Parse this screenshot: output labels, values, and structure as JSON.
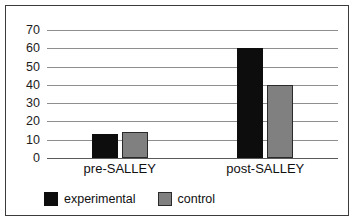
{
  "chart_data": {
    "type": "bar",
    "title": "",
    "xlabel": "",
    "ylabel": "",
    "categories": [
      "pre-SALLEY",
      "post-SALLEY"
    ],
    "series": [
      {
        "name": "experimental",
        "color": "#0d0d0d",
        "values": [
          13,
          60
        ]
      },
      {
        "name": "control",
        "color": "#808080",
        "values": [
          14,
          40
        ]
      }
    ],
    "ylim": [
      0,
      70
    ],
    "ytick_values": [
      0,
      10,
      20,
      30,
      40,
      50,
      60,
      70
    ],
    "ytick_labels": [
      "0",
      "10",
      "20",
      "30",
      "40",
      "50",
      "60",
      "70"
    ],
    "grid": true,
    "legend_position": "bottom-left"
  },
  "axis": {
    "yticks": [
      {
        "label": "70",
        "value": 70
      },
      {
        "label": "60",
        "value": 60
      },
      {
        "label": "50",
        "value": 50
      },
      {
        "label": "40",
        "value": 40
      },
      {
        "label": "30",
        "value": 30
      },
      {
        "label": "20",
        "value": 20
      },
      {
        "label": "10",
        "value": 10
      },
      {
        "label": "0",
        "value": 0
      }
    ]
  },
  "categories": [
    {
      "label": "pre-SALLEY"
    },
    {
      "label": "post-SALLEY"
    }
  ],
  "legend": {
    "entries": [
      {
        "label": "experimental",
        "color": "#0d0d0d"
      },
      {
        "label": "control",
        "color": "#808080"
      }
    ]
  }
}
